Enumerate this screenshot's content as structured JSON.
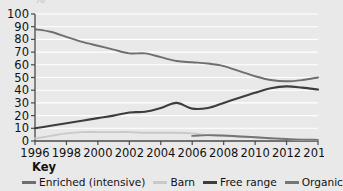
{
  "top_fragment": "%",
  "key": {
    "title": "Key"
  },
  "chart_data": {
    "type": "line",
    "title": "",
    "subtitle": "",
    "xlabel": "",
    "ylabel": "",
    "xlim": [
      1996,
      2014
    ],
    "ylim": [
      0,
      100
    ],
    "ytick_step": 10,
    "xtick_step": 2,
    "grid": true,
    "grid_orientation": "horizontal",
    "legend_position": "bottom",
    "yticks": [
      0,
      10,
      20,
      30,
      40,
      50,
      60,
      70,
      80,
      90,
      100
    ],
    "xticks": [
      1996,
      1998,
      2000,
      2002,
      2004,
      2006,
      2008,
      2010,
      2012,
      2014
    ],
    "x": [
      1996,
      1997,
      1998,
      1999,
      2000,
      2001,
      2002,
      2003,
      2004,
      2005,
      2006,
      2007,
      2008,
      2009,
      2010,
      2011,
      2012,
      2013,
      2014
    ],
    "series": [
      {
        "name": "Enriched (intensive)",
        "color": "#6e6e6e",
        "width": 1.9,
        "x": [
          1996,
          1997,
          1998,
          1999,
          2000,
          2001,
          2002,
          2003,
          2004,
          2005,
          2006,
          2007,
          2008,
          2009,
          2010,
          2011,
          2012,
          2013,
          2014
        ],
        "values": [
          88,
          86,
          82,
          78,
          75,
          72,
          69,
          69,
          66,
          63,
          62,
          61,
          59,
          55,
          51,
          48,
          47,
          48,
          50
        ]
      },
      {
        "name": "Barn",
        "color": "#c9c9c9",
        "width": 1.9,
        "x": [
          1996,
          1997,
          1998,
          1999,
          2000,
          2001,
          2002,
          2003,
          2004,
          2005,
          2006,
          2007,
          2008,
          2009,
          2010,
          2011,
          2012,
          2013,
          2014
        ],
        "values": [
          2,
          4,
          6,
          7,
          7,
          7,
          7,
          6.5,
          6.5,
          6.5,
          6,
          4.5,
          4,
          3.5,
          3,
          2,
          1.5,
          1,
          0.8
        ]
      },
      {
        "name": "Free range",
        "color": "#3d3d3d",
        "width": 2.1,
        "x": [
          1996,
          1997,
          1998,
          1999,
          2000,
          2001,
          2002,
          2003,
          2004,
          2005,
          2006,
          2007,
          2008,
          2009,
          2010,
          2011,
          2012,
          2013,
          2014
        ],
        "values": [
          10,
          12,
          14,
          16,
          18,
          20,
          22.5,
          23,
          26,
          30,
          25.5,
          26,
          30,
          34,
          38,
          41.5,
          43,
          42,
          40.5
        ]
      },
      {
        "name": "Organic",
        "color": "#757575",
        "width": 1.9,
        "x": [
          2006,
          2007,
          2008,
          2009,
          2010,
          2011,
          2012,
          2013,
          2014
        ],
        "values": [
          4,
          4.6,
          4.3,
          3.6,
          3,
          2.2,
          1.6,
          1.1,
          0.9
        ]
      }
    ]
  }
}
